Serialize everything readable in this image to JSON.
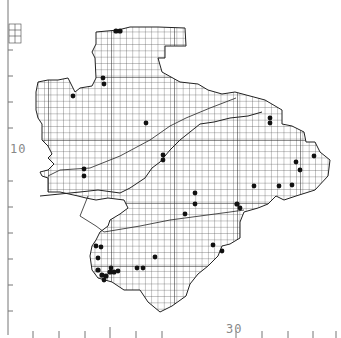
{
  "map": {
    "type": "grid distribution map",
    "axis_labels": {
      "left": "10",
      "bottom": "30"
    },
    "colors": {
      "grid": "#555555",
      "outline": "#222222",
      "dot": "#111111",
      "axis": "#777777"
    },
    "grid_cell_px": 6.3,
    "dots": [
      [
        116,
        31
      ],
      [
        120,
        31
      ],
      [
        103,
        78
      ],
      [
        104,
        84
      ],
      [
        73,
        96
      ],
      [
        146,
        123
      ],
      [
        163,
        155
      ],
      [
        163,
        160
      ],
      [
        84,
        169
      ],
      [
        84,
        176
      ],
      [
        185,
        214
      ],
      [
        195,
        193
      ],
      [
        195,
        204
      ],
      [
        270,
        118
      ],
      [
        270,
        123
      ],
      [
        296,
        162
      ],
      [
        300,
        170
      ],
      [
        314,
        156
      ],
      [
        254,
        186
      ],
      [
        279,
        186
      ],
      [
        292,
        185
      ],
      [
        237,
        204
      ],
      [
        240,
        208
      ],
      [
        96,
        246
      ],
      [
        101,
        247
      ],
      [
        98,
        258
      ],
      [
        98,
        270
      ],
      [
        102,
        275
      ],
      [
        106,
        276
      ],
      [
        110,
        272
      ],
      [
        114,
        272
      ],
      [
        118,
        271
      ],
      [
        111,
        268
      ],
      [
        104,
        280
      ],
      [
        137,
        268
      ],
      [
        143,
        268
      ],
      [
        155,
        257
      ],
      [
        213,
        245
      ],
      [
        222,
        251
      ]
    ]
  }
}
